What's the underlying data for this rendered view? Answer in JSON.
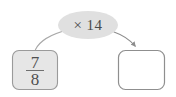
{
  "diagram": {
    "type": "function-machine",
    "background_color": "#ffffff",
    "operation_bubble": {
      "label": "× 14",
      "operator": "×",
      "operand": "14",
      "shape": "ellipse",
      "fill_color": "#e0e0e0",
      "text_color": "#4a4a4a"
    },
    "input_box": {
      "value": "7/8",
      "numerator": "7",
      "denominator": "8",
      "fill_color": "#e6e6e6",
      "border_color": "#9a9a9a",
      "text_color": "#4f4f4f"
    },
    "output_box": {
      "value": "",
      "placeholder": "",
      "fill_color": "#ffffff",
      "border_color": "#8f8f8f"
    },
    "connectors": [
      {
        "name": "input-to-operation",
        "from": "input_box",
        "to": "operation_bubble",
        "arrowhead": false,
        "color": "#a8a8a8"
      },
      {
        "name": "operation-to-output",
        "from": "operation_bubble",
        "to": "output_box",
        "arrowhead": true,
        "color": "#8d8d8d"
      }
    ]
  }
}
